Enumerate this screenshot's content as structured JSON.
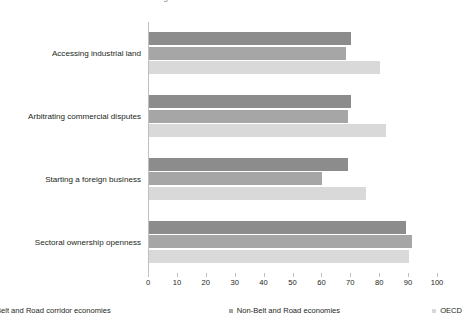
{
  "chart_data": {
    "type": "bar",
    "orientation": "horizontal",
    "title": "Figure: Investment climate indicators",
    "xlabel": "",
    "ylabel": "",
    "xlim": [
      0,
      100
    ],
    "xticks": [
      "0",
      "10",
      "20",
      "30",
      "40",
      "50",
      "60",
      "70",
      "80",
      "90",
      "100"
    ],
    "grid": false,
    "legend_position": "bottom",
    "categories": [
      "Accessing industrial land",
      "Arbitrating commercial disputes",
      "Starting a foreign business",
      "Sectoral ownership openness"
    ],
    "series": [
      {
        "name": "Belt and Road corridor economies",
        "color": "#8c8c8c",
        "values": [
          70,
          70,
          69,
          89
        ]
      },
      {
        "name": "Non-Belt and Road economies",
        "color": "#a6a6a6",
        "values": [
          68,
          69,
          60,
          91
        ]
      },
      {
        "name": "OECD",
        "color": "#d9d9d9",
        "values": [
          80,
          82,
          75,
          90
        ]
      }
    ]
  }
}
